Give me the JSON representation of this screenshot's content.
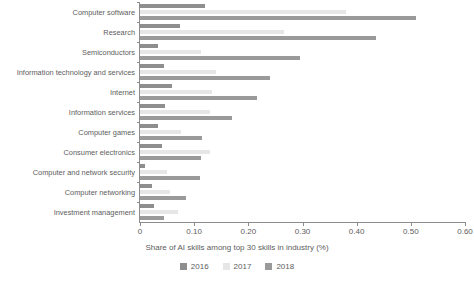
{
  "chart_data": {
    "type": "bar",
    "orientation": "horizontal",
    "title": "",
    "xlabel": "Share of AI skills among top 30 skills in industry (%)",
    "ylabel": "",
    "xlim": [
      0,
      0.6
    ],
    "xticks": [
      "0",
      "0.10",
      "0.20",
      "0.30",
      "0.40",
      "0.50",
      "0.60"
    ],
    "xtick_values": [
      0,
      0.1,
      0.2,
      0.3,
      0.4,
      0.5,
      0.6
    ],
    "grid": false,
    "legend_position": "bottom",
    "categories": [
      "Computer software",
      "Research",
      "Semiconductors",
      "Information technology and services",
      "Internet",
      "Information services",
      "Computer games",
      "Consumer electronics",
      "Computer and network security",
      "Computer networking",
      "Investment management"
    ],
    "series": [
      {
        "name": "2016",
        "color": "#8e8e8e",
        "values": [
          0.12,
          0.074,
          0.033,
          0.045,
          0.059,
          0.046,
          0.033,
          0.04,
          0.009,
          0.022,
          0.026
        ]
      },
      {
        "name": "2017",
        "color": "#e6e6e6",
        "values": [
          0.38,
          0.266,
          0.112,
          0.14,
          0.133,
          0.13,
          0.075,
          0.13,
          0.05,
          0.055,
          0.07
        ]
      },
      {
        "name": "2018",
        "color": "#9a9a9a",
        "values": [
          0.51,
          0.436,
          0.295,
          0.24,
          0.216,
          0.17,
          0.114,
          0.112,
          0.11,
          0.085,
          0.044
        ]
      }
    ]
  },
  "legend": {
    "items": [
      {
        "label": "2016",
        "color": "#8e8e8e"
      },
      {
        "label": "2017",
        "color": "#e6e6e6"
      },
      {
        "label": "2018",
        "color": "#9a9a9a"
      }
    ]
  }
}
